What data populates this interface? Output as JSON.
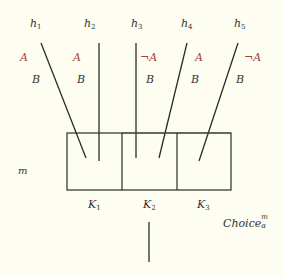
{
  "diagram": {
    "hypotheses": [
      {
        "name": "h",
        "index": "1",
        "x": 30,
        "label_a": "A",
        "label_a_negated": false,
        "label_b": "B",
        "line": [
          41,
          43,
          86,
          158
        ]
      },
      {
        "name": "h",
        "index": "2",
        "x": 83,
        "label_a": "A",
        "label_a_negated": false,
        "label_b": "B",
        "line": [
          99,
          43,
          99,
          161
        ]
      },
      {
        "name": "h",
        "index": "3",
        "x": 131,
        "label_a": "¬A",
        "label_a_negated": true,
        "label_b": "B",
        "line": [
          136,
          43,
          136,
          158
        ]
      },
      {
        "name": "h",
        "index": "4",
        "x": 181,
        "label_a": "A",
        "label_a_negated": false,
        "label_b": "B",
        "line": [
          187,
          43,
          159,
          158
        ]
      },
      {
        "name": "h",
        "index": "5",
        "x": 234,
        "label_a": "¬A",
        "label_a_negated": true,
        "label_b": "B",
        "line": [
          238,
          43,
          199,
          161
        ]
      }
    ],
    "h1": "h",
    "h1_sub": "1",
    "h2": "h",
    "h2_sub": "2",
    "h3": "h",
    "h3_sub": "3",
    "h4": "h",
    "h4_sub": "4",
    "h5": "h",
    "h5_sub": "5",
    "a1": "A",
    "b1": "B",
    "a2": "A",
    "b2": "B",
    "a3": "¬A",
    "b3": "B",
    "a4": "A",
    "b4": "B",
    "a5": "¬A",
    "b5": "B",
    "box_label": "m",
    "cells": [
      {
        "name": "K",
        "index": "1"
      },
      {
        "name": "K",
        "index": "2"
      },
      {
        "name": "K",
        "index": "3"
      }
    ],
    "k1": "K",
    "k1_sub": "1",
    "k2": "K",
    "k2_sub": "2",
    "k3": "K",
    "k3_sub": "3",
    "choice_label": "Choice",
    "choice_sup": "m",
    "choice_sub": "α",
    "colors": {
      "background": "#fdfdf2",
      "line": "#2b2b2b",
      "text": "#333333",
      "literal_a": "#a4453a"
    }
  }
}
